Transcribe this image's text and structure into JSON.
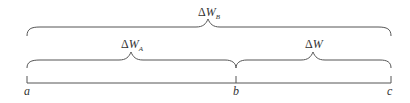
{
  "diagram": {
    "braces": [
      {
        "name": "total",
        "label_prefix": "Δ",
        "label_var": "W",
        "label_sub": "B",
        "from": "a",
        "to": "c"
      },
      {
        "name": "left",
        "label_prefix": "Δ",
        "label_var": "W",
        "label_sub": "A",
        "from": "a",
        "to": "b"
      },
      {
        "name": "right",
        "label_prefix": "Δ",
        "label_var": "W",
        "label_sub": "",
        "from": "b",
        "to": "c"
      }
    ],
    "points": [
      {
        "label": "a"
      },
      {
        "label": "b"
      },
      {
        "label": "c"
      }
    ]
  }
}
